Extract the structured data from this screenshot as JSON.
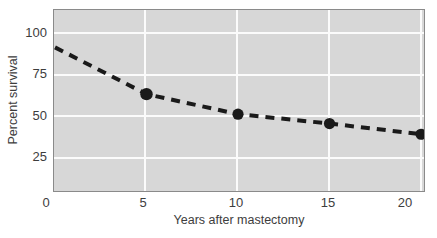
{
  "chart_data": {
    "type": "line",
    "title": "",
    "xlabel": "Years after mastectomy",
    "ylabel": "Percent survival",
    "x": [
      0,
      5,
      10,
      15,
      20
    ],
    "values": [
      100,
      65,
      50,
      43,
      35
    ],
    "series": [
      {
        "name": "Percent survival",
        "x": [
          0,
          5,
          10,
          15,
          20
        ],
        "values": [
          100,
          65,
          50,
          43,
          35
        ]
      }
    ],
    "xlim": [
      0,
      20
    ],
    "ylim": [
      0,
      110
    ],
    "xticks": [
      0,
      5,
      10,
      15,
      20
    ],
    "yticks": [
      25,
      50,
      75,
      100
    ],
    "xtick_labels": [
      "0",
      "5",
      "10",
      "15",
      "20"
    ],
    "ytick_labels": [
      "25",
      "50",
      "75",
      "100"
    ],
    "grid": true,
    "grid_color": "#fbfbfb",
    "legend": null,
    "legend_position": "none",
    "line_style": "dashed",
    "line_color": "#1a1a1a",
    "marker": "circle",
    "marker_color": "#1a1a1a",
    "plot_background": "#d7d7d7",
    "figure_background": "#ffffff",
    "markers_drawn_at": [
      5,
      10,
      15,
      20
    ]
  },
  "axes": {
    "y_ticks": [
      {
        "label": "100",
        "value": 100
      },
      {
        "label": "75",
        "value": 75
      },
      {
        "label": "50",
        "value": 50
      },
      {
        "label": "25",
        "value": 25
      }
    ],
    "x_ticks": [
      {
        "label": "0",
        "value": 0
      },
      {
        "label": "5",
        "value": 5
      },
      {
        "label": "10",
        "value": 10
      },
      {
        "label": "15",
        "value": 15
      },
      {
        "label": "20",
        "value": 20
      }
    ],
    "y_title": "Percent survival",
    "x_title": "Years after mastectomy"
  }
}
